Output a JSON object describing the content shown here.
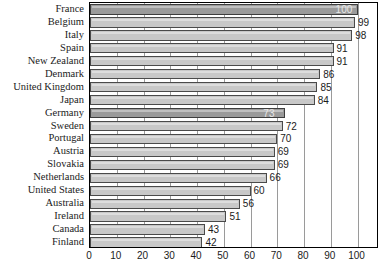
{
  "chart_data": {
    "type": "bar",
    "orientation": "horizontal",
    "title": "",
    "subtitle": "",
    "xlabel": "",
    "ylabel": "",
    "xlim": [
      0,
      108
    ],
    "xticks": [
      0,
      10,
      20,
      30,
      40,
      50,
      60,
      70,
      80,
      90,
      100
    ],
    "xtick_labels": [
      "0",
      "10",
      "20",
      "30",
      "40",
      "50",
      "60",
      "70",
      "80",
      "90",
      "100"
    ],
    "grid": true,
    "legend": false,
    "categories": [
      "France",
      "Belgium",
      "Italy",
      "Spain",
      "New Zealand",
      "Denmark",
      "United Kingdom",
      "Japan",
      "Germany",
      "Sweden",
      "Portugal",
      "Austria",
      "Slovakia",
      "Netherlands",
      "United States",
      "Australia",
      "Ireland",
      "Canada",
      "Finland"
    ],
    "values": [
      100,
      99,
      98,
      91,
      91,
      86,
      85,
      84,
      73,
      72,
      70,
      69,
      69,
      66,
      60,
      56,
      51,
      43,
      42
    ],
    "value_labels": [
      "100",
      "99",
      "98",
      "91",
      "91",
      "86",
      "85",
      "84",
      "73",
      "72",
      "70",
      "69",
      "69",
      "66",
      "60",
      "56",
      "51",
      "43",
      "42"
    ],
    "highlighted": [
      "France",
      "Germany"
    ],
    "colors": {
      "bar": "#c8c8c8",
      "bar_highlight": "#9a9a9a",
      "bar_edge": "#4a4a4a",
      "grid": "#9a9a9a",
      "axis": "#000000",
      "text": "#1b1b1b",
      "text_inside_bar": "#e8e8e8",
      "background": "#ffffff"
    }
  }
}
